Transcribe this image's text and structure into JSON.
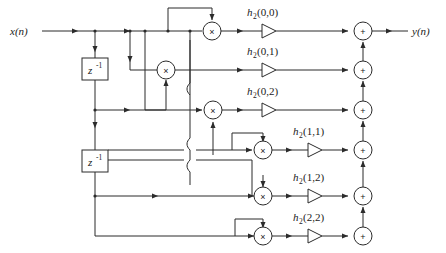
{
  "diagram": {
    "type": "signal-flow-graph",
    "input": {
      "label": "x(n)"
    },
    "output": {
      "label": "y(n)"
    },
    "delays": [
      {
        "name": "delay-1",
        "label": "z",
        "exponent": "-1"
      },
      {
        "name": "delay-2",
        "label": "z",
        "exponent": "-1"
      }
    ],
    "branches": [
      {
        "id": "row-1",
        "gain_base": "h",
        "gain_sub": "2",
        "gain_args": "(0,0)",
        "gain_label": "h2(0,0)",
        "multiplier": "×",
        "adder": "+"
      },
      {
        "id": "row-2",
        "gain_base": "h",
        "gain_sub": "2",
        "gain_args": "(0,1)",
        "gain_label": "h2(0,1)",
        "multiplier": "×",
        "adder": "+"
      },
      {
        "id": "row-3",
        "gain_base": "h",
        "gain_sub": "2",
        "gain_args": "(0,2)",
        "gain_label": "h2(0,2)",
        "multiplier": "×",
        "adder": "+"
      },
      {
        "id": "row-4",
        "gain_base": "h",
        "gain_sub": "2",
        "gain_args": "(1,1)",
        "gain_label": "h2(1,1)",
        "multiplier": "×",
        "adder": "+"
      },
      {
        "id": "row-5",
        "gain_base": "h",
        "gain_sub": "2",
        "gain_args": "(1,2)",
        "gain_label": "h2(1,2)",
        "multiplier": "×",
        "adder": "+"
      },
      {
        "id": "row-6",
        "gain_base": "h",
        "gain_sub": "2",
        "gain_args": "(2,2)",
        "gain_label": "h2(2,2)",
        "multiplier": "×",
        "adder": "+"
      }
    ],
    "colors": {
      "line": "#2b2b2b",
      "text": "#1a1a1a",
      "background": "#ffffff"
    }
  }
}
